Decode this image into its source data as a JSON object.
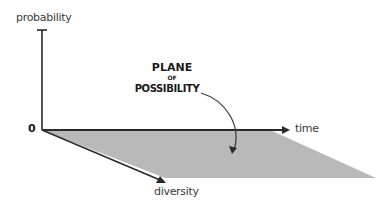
{
  "diagram": {
    "y_axis_label": "probability",
    "x_axis_label": "time",
    "z_axis_label": "diversity",
    "origin_label": "0",
    "annotation": {
      "line1": "PLANE",
      "line2": "OF",
      "line3": "POSSIBILITY"
    },
    "colors": {
      "plane_fill": "#b9b9b9",
      "axis_stroke": "#2a2a2a",
      "text": "#3a3a3a"
    }
  }
}
